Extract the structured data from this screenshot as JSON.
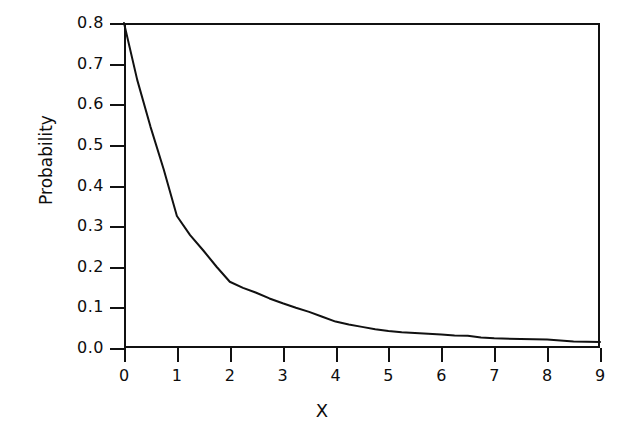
{
  "chart_data": {
    "type": "line",
    "title": "",
    "xlabel": "X",
    "ylabel": "Probability",
    "xlim": [
      0,
      9
    ],
    "ylim": [
      0.0,
      0.8
    ],
    "grid": false,
    "legend": null,
    "xticks": [
      "0",
      "1",
      "2",
      "3",
      "4",
      "5",
      "6",
      "7",
      "8",
      "9"
    ],
    "yticks": [
      "0.0",
      "0.1",
      "0.2",
      "0.3",
      "0.4",
      "0.5",
      "0.6",
      "0.7",
      "0.8"
    ],
    "series": [
      {
        "name": "Probability",
        "color": "#111111",
        "x": [
          0,
          0.25,
          0.5,
          0.75,
          1,
          1.25,
          1.5,
          1.75,
          2,
          2.25,
          2.5,
          2.75,
          3,
          3.25,
          3.5,
          3.75,
          4,
          4.25,
          4.5,
          4.75,
          5,
          5.25,
          5.5,
          5.75,
          6,
          6.25,
          6.5,
          6.75,
          7,
          7.5,
          8,
          8.5,
          9
        ],
        "values": [
          0.8,
          0.66,
          0.545,
          0.44,
          0.325,
          0.278,
          0.24,
          0.2,
          0.163,
          0.148,
          0.136,
          0.122,
          0.11,
          0.099,
          0.089,
          0.077,
          0.065,
          0.058,
          0.052,
          0.046,
          0.042,
          0.039,
          0.037,
          0.035,
          0.033,
          0.031,
          0.03,
          0.026,
          0.024,
          0.022,
          0.021,
          0.016,
          0.015
        ]
      }
    ]
  }
}
